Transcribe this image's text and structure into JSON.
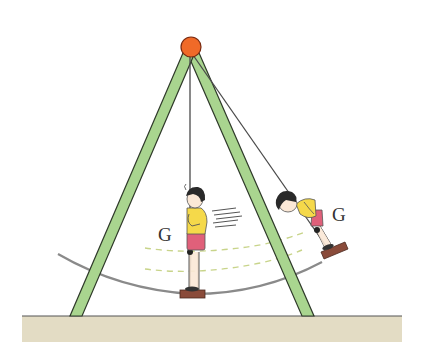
{
  "figure": {
    "labels": {
      "g_left": "G",
      "g_right": "G"
    },
    "colors": {
      "frame_fill": "#a9d58f",
      "frame_stroke": "#2f3a2a",
      "pivot_ball": "#f06a28",
      "pivot_stroke": "#7a2a10",
      "rope": "#4a4a4a",
      "arc_path": "#8a8a8a",
      "dashed_lines": "#c8d48a",
      "ground": "#e3dcc4",
      "ground_line": "#555555",
      "seat": "#8a4b3a",
      "shirt": "#f5d94a",
      "shorts": "#e0607a",
      "hair": "#2a2a2a",
      "skin": "#fbe8d6"
    }
  }
}
